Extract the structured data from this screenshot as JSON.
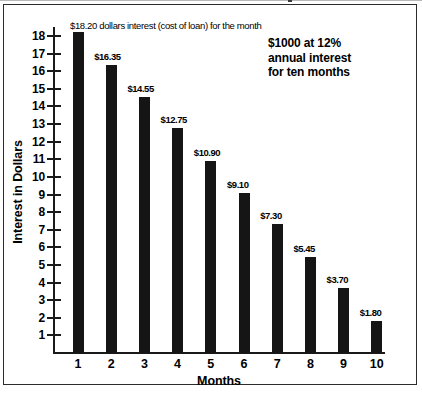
{
  "chart_data": {
    "type": "bar",
    "title": "",
    "xlabel": "Months",
    "ylabel": "Interest in Dollars",
    "categories": [
      "1",
      "2",
      "3",
      "4",
      "5",
      "6",
      "7",
      "8",
      "9",
      "10"
    ],
    "values": [
      18.2,
      16.35,
      14.55,
      12.75,
      10.9,
      9.1,
      7.3,
      5.45,
      3.7,
      1.8
    ],
    "value_labels": [
      "$18.20",
      "$16.35",
      "$14.55",
      "$12.75",
      "$10.90",
      "$9.10",
      "$7.30",
      "$5.45",
      "$3.70",
      "$1.80"
    ],
    "ylim": [
      0,
      18.6
    ],
    "ytick_labels": [
      "18",
      "17",
      "16",
      "15",
      "14",
      "13",
      "12",
      "11",
      "10",
      "9",
      "8",
      "7",
      "6",
      "5",
      "4",
      "3",
      "2",
      "1"
    ],
    "ytick_values": [
      18,
      17,
      16,
      15,
      14,
      13,
      12,
      11,
      10,
      9,
      8,
      7,
      6,
      5,
      4,
      3,
      2,
      1
    ],
    "grid": false,
    "legend": "none",
    "bar_color": "#151515",
    "annotations": {
      "first_bar_note": "$18.20 dollars interest (cost of loan) for the month",
      "side_note_lines": [
        "$1000 at 12%",
        "annual interest",
        "for ten months"
      ]
    }
  }
}
